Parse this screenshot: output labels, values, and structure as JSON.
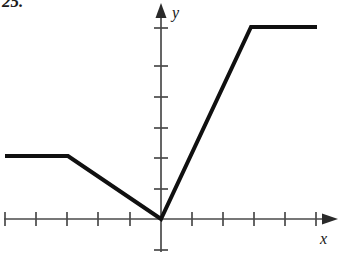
{
  "exercise": {
    "number": "25."
  },
  "axes": {
    "x_label": "x",
    "y_label": "y",
    "x_arrow": "arrow-right",
    "y_arrow": "arrow-up",
    "tick_spacing_px": 30,
    "origin_px": {
      "x": 161,
      "y": 219
    },
    "x_ticks_left": 5,
    "x_ticks_right": 5,
    "y_ticks_up": 6,
    "y_ticks_down": 1,
    "x_range": [
      -5.3,
      5.3
    ],
    "y_range": [
      -1.3,
      6.8
    ],
    "grid": false
  },
  "chart_data": {
    "type": "line",
    "title": "",
    "xlabel": "x",
    "ylabel": "y",
    "xlim": [
      -5.4,
      5.4
    ],
    "ylim": [
      -1.4,
      6.8
    ],
    "grid": false,
    "legend": null,
    "series": [
      {
        "name": "piecewise-linear-graph",
        "x": [
          -5.2,
          -3.1,
          0,
          3.0,
          5.2
        ],
        "y": [
          2.1,
          2.1,
          0,
          6.4,
          6.4
        ]
      }
    ],
    "segments": [
      {
        "name": "left-horizontal-ray",
        "from": [
          -5.2,
          2.1
        ],
        "to": [
          -3.1,
          2.1
        ]
      },
      {
        "name": "descending-segment",
        "from": [
          -3.1,
          2.1
        ],
        "to": [
          0,
          0
        ]
      },
      {
        "name": "ascending-segment",
        "from": [
          0,
          0
        ],
        "to": [
          3.0,
          6.4
        ]
      },
      {
        "name": "right-horizontal-ray",
        "from": [
          3.0,
          6.4
        ],
        "to": [
          5.2,
          6.4
        ]
      }
    ],
    "vertex": [
      0,
      0
    ],
    "annotations": []
  },
  "style": {
    "curve_color": "#101010",
    "axis_color": "#4a4a4a",
    "background": "#ffffff",
    "curve_width_px": 4,
    "axis_width_px": 1.6
  }
}
